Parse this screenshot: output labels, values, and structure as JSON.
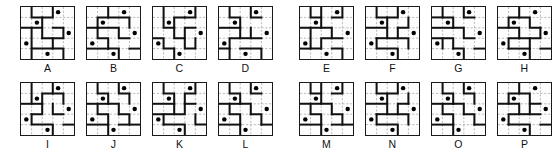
{
  "figure": {
    "grid_size": 5,
    "rows": 2,
    "columns_per_row": 8,
    "groups_per_row": 2,
    "panels_per_group": 4,
    "colors": {
      "background": "#ffffff",
      "panel_background": "#fdfdfd",
      "border": "#1a1a1a",
      "path": "#111111",
      "gridline": "#9a9a9a",
      "dot": "#000000",
      "label": "#111111"
    },
    "dot_count_per_panel": 5,
    "dot_positions": [
      {
        "x": 3.5,
        "y": 0.5
      },
      {
        "x": 1.5,
        "y": 1.5
      },
      {
        "x": 4.5,
        "y": 2.5
      },
      {
        "x": 0.5,
        "y": 3.5
      },
      {
        "x": 2.5,
        "y": 4.5
      }
    ]
  },
  "rows": [
    {
      "name": "top-row",
      "groups": [
        {
          "name": "top-left-group",
          "panels": [
            {
              "label": "A",
              "label_position": "below",
              "paths": [
                "M 1 0 L 1 1 L 3 1 L 3 0",
                "M 0 2 L 2 2 L 2 1",
                "M 2 3 L 2 2",
                "M 2 3 L 4 3 L 4 2 L 3 2",
                "M 1 2 L 1 4 L 3 4 L 3 3",
                "M 3 4 L 4 4 L 4 5",
                "M 1 4 L 1 5"
              ]
            },
            {
              "label": "B",
              "label_position": "below",
              "paths": [
                "M 2 0 L 2 1 L 1 1 L 1 2 L 0 2",
                "M 2 1 L 4 1 L 4 2",
                "M 1 2 L 3 2 L 3 3 L 4 3",
                "M 1 2 L 1 3 L 2 3 L 2 4",
                "M 0 4 L 2 4",
                "M 2 4 L 3 4 L 3 5",
                "M 4 4 L 5 4"
              ]
            },
            {
              "label": "C",
              "label_position": "below",
              "paths": [
                "M 1 0 L 1 2 L 2 2",
                "M 3 1 L 4 1 L 4 0",
                "M 2 2 L 2 1 L 3 1",
                "M 2 2 L 2 3 L 3 3 L 3 2 L 4 2",
                "M 0 3 L 1 3 L 1 4 L 2 4",
                "M 3 3 L 3 4 L 4 4 L 4 3",
                "M 2 4 L 2 5"
              ]
            },
            {
              "label": "D",
              "label_position": "below",
              "paths": [
                "M 1 0 L 1 1 L 2 1 L 2 2",
                "M 3 0 L 3 1 L 4 1",
                "M 0 2 L 2 2",
                "M 2 2 L 2 3 L 1 3 L 1 4",
                "M 3 2 L 3 3 L 4 3",
                "M 0 4 L 1 4 L 1 5",
                "M 2 4 L 4 4 L 4 5",
                "M 2 3 L 3 3"
              ]
            }
          ]
        },
        {
          "name": "top-right-group",
          "panels": [
            {
              "label": "E",
              "label_position": "below",
              "paths": [
                "M 1 0 L 1 1 L 2 1 L 2 0",
                "M 3 1 L 4 1 L 4 0",
                "M 0 2 L 2 2 L 2 1",
                "M 2 2 L 3 2 L 3 3 L 4 3",
                "M 1 2 L 1 4 L 2 4",
                "M 2 4 L 2 3 L 3 3",
                "M 3 4 L 4 4 L 4 5",
                "M 0 4 L 1 4"
              ]
            },
            {
              "label": "F",
              "label_position": "below",
              "paths": [
                "M 1 0 L 1 1 L 3 1 L 3 0",
                "M 4 1 L 4 2 L 3 2",
                "M 0 2 L 2 2 L 2 1",
                "M 2 2 L 2 3 L 3 3 L 3 2",
                "M 1 3 L 2 3",
                "M 1 3 L 1 4 L 3 4 L 3 5",
                "M 3 3 L 4 3 L 4 4"
              ]
            },
            {
              "label": "G",
              "label_position": "below",
              "paths": [
                "M 1 0 L 1 1 L 2 1 L 2 2",
                "M 0 1 L 1 1",
                "M 3 0 L 3 1 L 4 1",
                "M 0 2 L 2 2",
                "M 2 2 L 3 2 L 3 3 L 4 3",
                "M 1 3 L 2 3 L 2 4",
                "M 0 3 L 1 3 L 1 4",
                "M 2 4 L 3 4 L 3 5",
                "M 4 4 L 5 4"
              ]
            },
            {
              "label": "H",
              "label_position": "below",
              "paths": [
                "M 2 0 L 2 1 L 1 1 L 1 2 L 0 2",
                "M 2 1 L 3 1 L 3 2 L 4 2",
                "M 1 2 L 2 2 L 2 3",
                "M 2 3 L 1 3 L 1 4",
                "M 3 3 L 4 3 L 4 2",
                "M 2 3 L 3 3 L 3 4",
                "M 1 4 L 3 4",
                "M 3 4 L 3 5",
                "M 4 4 L 5 4"
              ]
            }
          ]
        }
      ]
    },
    {
      "name": "bottom-row",
      "groups": [
        {
          "name": "bottom-left-group",
          "panels": [
            {
              "label": "I",
              "label_position": "below",
              "paths": [
                "M 1 0 L 1 2",
                "M 3 0 L 3 1 L 2 1 L 2 2",
                "M 0 2 L 2 2",
                "M 2 2 L 2 3 L 1 3",
                "M 3 1 L 4 1 L 4 2",
                "M 3 2 L 3 3 L 4 3",
                "M 1 3 L 1 4 L 3 4 L 3 5",
                "M 4 4 L 5 4"
              ]
            },
            {
              "label": "J",
              "label_position": "below",
              "paths": [
                "M 1 0 L 1 1 L 2 1 L 2 2",
                "M 3 0 L 3 1 L 4 1 L 4 2",
                "M 0 2 L 2 2",
                "M 2 2 L 3 2 L 3 3",
                "M 1 2 L 1 3 L 2 3 L 2 4",
                "M 3 3 L 4 3 L 4 4",
                "M 0 4 L 2 4",
                "M 2 4 L 2 5",
                "M 3 4 L 5 4"
              ]
            },
            {
              "label": "K",
              "label_position": "below",
              "paths": [
                "M 1 0 L 1 1 L 2 1 L 2 2",
                "M 4 0 L 4 1 L 3 1 L 3 2",
                "M 0 2 L 2 2",
                "M 2 2 L 2 3 L 3 3 L 3 2",
                "M 3 2 L 4 2",
                "M 1 3 L 2 3",
                "M 0 3 L 1 3 L 1 4",
                "M 1 4 L 3 4 L 3 5",
                "M 4 3 L 4 4 L 5 4"
              ]
            },
            {
              "label": "L",
              "label_position": "below",
              "paths": [
                "M 1 0 L 1 1 L 2 1 L 2 2",
                "M 3 0 L 3 1 L 4 1",
                "M 0 2 L 2 2",
                "M 2 2 L 3 2 L 3 3",
                "M 1 2 L 1 3 L 2 3 L 2 4",
                "M 3 3 L 4 3 L 4 4",
                "M 0 4 L 2 4",
                "M 2 4 L 2 5",
                "M 4 4 L 5 4"
              ]
            }
          ]
        },
        {
          "name": "bottom-right-group",
          "panels": [
            {
              "label": "M",
              "label_position": "below",
              "paths": [
                "M 1 0 L 1 1 L 2 1 L 2 0",
                "M 3 1 L 4 1 L 4 0",
                "M 0 2 L 2 2 L 2 1",
                "M 2 2 L 3 2 L 3 3",
                "M 1 2 L 1 3 L 2 3 L 2 4",
                "M 3 3 L 4 3 L 4 4",
                "M 0 4 L 2 4",
                "M 2 4 L 2 5",
                "M 3 4 L 5 4"
              ]
            },
            {
              "label": "N",
              "label_position": "below",
              "paths": [
                "M 1 0 L 1 1 L 3 1 L 3 0",
                "M 4 1 L 4 2",
                "M 0 2 L 2 2 L 2 1",
                "M 2 2 L 2 3 L 3 3 L 3 2 L 4 2",
                "M 1 3 L 2 3",
                "M 1 3 L 1 4 L 3 4 L 3 5",
                "M 3 3 L 4 3 L 4 4"
              ]
            },
            {
              "label": "O",
              "label_position": "below",
              "paths": [
                "M 1 0 L 1 1 L 2 1 L 2 2",
                "M 3 0 L 3 1 L 4 1 L 4 2",
                "M 0 2 L 2 2",
                "M 2 2 L 3 2 L 3 3",
                "M 1 2 L 1 3 L 2 3 L 2 4",
                "M 3 3 L 4 3 L 4 4",
                "M 0 4 L 2 4",
                "M 2 4 L 2 5",
                "M 4 4 L 5 4"
              ]
            },
            {
              "label": "P",
              "label_position": "below",
              "paths": [
                "M 2 0 L 2 1 L 1 1 L 1 2 L 0 2",
                "M 2 1 L 3 1 L 3 2 L 4 2",
                "M 1 2 L 2 2 L 2 3 L 1 3 L 1 4",
                "M 3 2 L 3 3 L 4 3",
                "M 2 3 L 3 3",
                "M 1 4 L 3 4 L 3 5",
                "M 4 4 L 5 4"
              ]
            }
          ]
        }
      ]
    }
  ]
}
